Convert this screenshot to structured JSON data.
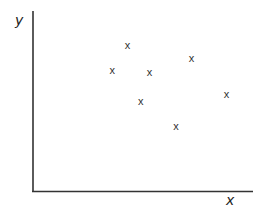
{
  "chart_data": {
    "type": "scatter",
    "title": "",
    "xlabel": "x",
    "ylabel": "y",
    "marker": "x",
    "grid": false,
    "legend": null,
    "ticks": false,
    "xlim": [
      0,
      10
    ],
    "ylim": [
      0,
      10
    ],
    "points": [
      {
        "x": 4.3,
        "y": 8.1
      },
      {
        "x": 3.6,
        "y": 6.7
      },
      {
        "x": 5.3,
        "y": 6.6
      },
      {
        "x": 7.2,
        "y": 7.4
      },
      {
        "x": 4.9,
        "y": 5.0
      },
      {
        "x": 8.8,
        "y": 5.4
      },
      {
        "x": 6.5,
        "y": 3.6
      }
    ],
    "colors": {
      "axis": "#333333",
      "marker": "#333333"
    }
  }
}
